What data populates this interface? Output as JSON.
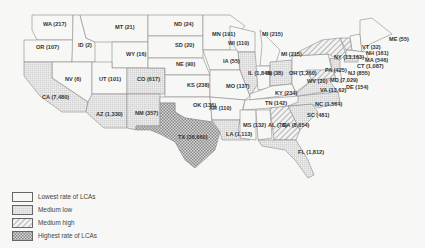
{
  "map": {
    "title": "",
    "colors": {
      "background": "#f7f7f5",
      "border": "#888888",
      "lowest": "#f7f7f5",
      "medium_low": "#d9d9d9",
      "medium_high": "#c8c8c8",
      "highest": "#a9a9a9"
    },
    "legend": [
      {
        "key": "lowest",
        "label": "Lowest rate of LCAs"
      },
      {
        "key": "medium_low",
        "label": "Medium low"
      },
      {
        "key": "medium_high",
        "label": "Medium high"
      },
      {
        "key": "highest",
        "label": "Highest rate of LCAs"
      }
    ],
    "states": [
      {
        "abbr": "WA",
        "label": "WA (217)",
        "value": 217,
        "category": "lowest"
      },
      {
        "abbr": "OR",
        "label": "OR (107)",
        "value": 107,
        "category": "lowest"
      },
      {
        "abbr": "ID",
        "label": "ID (2)",
        "value": 2,
        "category": "lowest"
      },
      {
        "abbr": "MT",
        "label": "MT (21)",
        "value": 21,
        "category": "lowest"
      },
      {
        "abbr": "WY",
        "label": "WY (16)",
        "value": 16,
        "category": "lowest"
      },
      {
        "abbr": "NV",
        "label": "NV (6)",
        "value": 6,
        "category": "lowest"
      },
      {
        "abbr": "UT",
        "label": "UT (101)",
        "value": 101,
        "category": "lowest"
      },
      {
        "abbr": "CO",
        "label": "CO (617)",
        "value": 617,
        "category": "medium_low"
      },
      {
        "abbr": "CA",
        "label": "CA (7,480)",
        "value": 7480,
        "category": "medium_low"
      },
      {
        "abbr": "AZ",
        "label": "AZ (1,330)",
        "value": 1330,
        "category": "medium_low"
      },
      {
        "abbr": "NM",
        "label": "NM (357)",
        "value": 357,
        "category": "medium_low"
      },
      {
        "abbr": "ND",
        "label": "ND (24)",
        "value": 24,
        "category": "lowest"
      },
      {
        "abbr": "SD",
        "label": "SD (20)",
        "value": 20,
        "category": "lowest"
      },
      {
        "abbr": "NE",
        "label": "NE (90)",
        "value": 90,
        "category": "lowest"
      },
      {
        "abbr": "KS",
        "label": "KS (238)",
        "value": 238,
        "category": "lowest"
      },
      {
        "abbr": "OK",
        "label": "OK (136)",
        "value": 136,
        "category": "lowest"
      },
      {
        "abbr": "TX",
        "label": "TX (36,660)",
        "value": 36660,
        "category": "highest"
      },
      {
        "abbr": "MN",
        "label": "MN (191)",
        "value": 191,
        "category": "lowest"
      },
      {
        "abbr": "IA",
        "label": "IA (55)",
        "value": 55,
        "category": "lowest"
      },
      {
        "abbr": "MO",
        "label": "MO (137)",
        "value": 137,
        "category": "lowest"
      },
      {
        "abbr": "AR",
        "label": "AR (110)",
        "value": 110,
        "category": "lowest"
      },
      {
        "abbr": "LA",
        "label": "LA (1,113)",
        "value": 1113,
        "category": "medium_low"
      },
      {
        "abbr": "WI",
        "label": "WI (110)",
        "value": 110,
        "category": "lowest"
      },
      {
        "abbr": "IL",
        "label": "IL (1,848)",
        "value": 1848,
        "category": "medium_low"
      },
      {
        "abbr": "MI",
        "label": "MI (215)",
        "value": 215,
        "category": "lowest"
      },
      {
        "abbr": "MI2",
        "label": "MI (215)",
        "value": 215,
        "category": "lowest"
      },
      {
        "abbr": "IN",
        "label": "IN (38)",
        "value": 38,
        "category": "lowest"
      },
      {
        "abbr": "OH",
        "label": "OH (1,260)",
        "value": 1260,
        "category": "medium_low"
      },
      {
        "abbr": "KY",
        "label": "KY (234)",
        "value": 234,
        "category": "lowest"
      },
      {
        "abbr": "TN",
        "label": "TN (142)",
        "value": 142,
        "category": "lowest"
      },
      {
        "abbr": "MS",
        "label": "MS (132)",
        "value": 132,
        "category": "lowest"
      },
      {
        "abbr": "AL",
        "label": "AL (78)",
        "value": 78,
        "category": "lowest"
      },
      {
        "abbr": "GA",
        "label": "GA (8,654)",
        "value": 8654,
        "category": "medium_high"
      },
      {
        "abbr": "FL",
        "label": "FL (1,812)",
        "value": 1812,
        "category": "medium_low"
      },
      {
        "abbr": "SC",
        "label": "SC (481)",
        "value": 481,
        "category": "medium_low"
      },
      {
        "abbr": "NC",
        "label": "NC (1,564)",
        "value": 1564,
        "category": "medium_low"
      },
      {
        "abbr": "VA",
        "label": "VA (13,62)",
        "value": 1362,
        "category": "medium_low"
      },
      {
        "abbr": "WV",
        "label": "WV (20)",
        "value": 20,
        "category": "lowest"
      },
      {
        "abbr": "MD",
        "label": "MD (7,029)",
        "value": 7029,
        "category": "medium_high"
      },
      {
        "abbr": "DE",
        "label": "DE (154)",
        "value": 154,
        "category": "lowest"
      },
      {
        "abbr": "PA",
        "label": "PA (425)",
        "value": 425,
        "category": "lowest"
      },
      {
        "abbr": "NJ",
        "label": "NJ (855)",
        "value": 855,
        "category": "medium_low"
      },
      {
        "abbr": "NY",
        "label": "NY (13,163)",
        "value": 13163,
        "category": "medium_high"
      },
      {
        "abbr": "CT",
        "label": "CT (1,087)",
        "value": 1087,
        "category": "medium_low"
      },
      {
        "abbr": "MA",
        "label": "MA (546)",
        "value": 546,
        "category": "lowest"
      },
      {
        "abbr": "VT",
        "label": "VT (32)",
        "value": 32,
        "category": "medium_high"
      },
      {
        "abbr": "NH",
        "label": "NH (161)",
        "value": 161,
        "category": "lowest"
      },
      {
        "abbr": "ME",
        "label": "ME (55)",
        "value": 55,
        "category": "lowest"
      }
    ]
  }
}
